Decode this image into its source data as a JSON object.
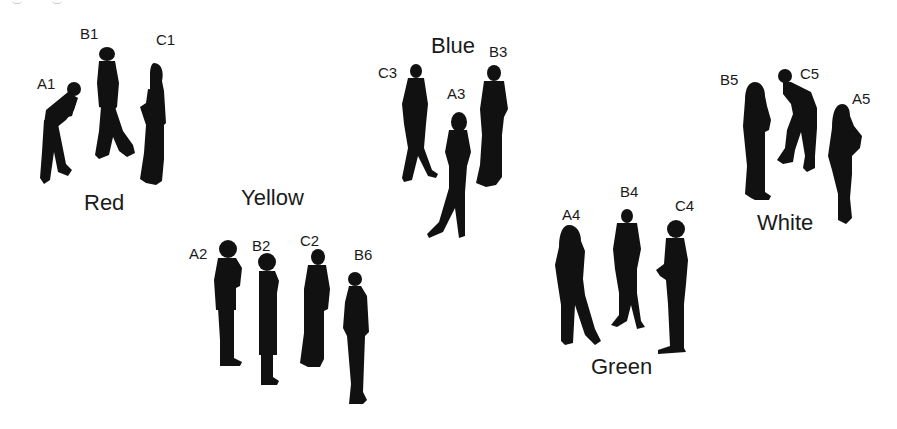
{
  "diagram": {
    "type": "grouped-people-silhouettes",
    "colors": {
      "ink": "#111111",
      "background": "#ffffff",
      "text": "#1a1a1a"
    },
    "groups": [
      {
        "name": "Red",
        "members": [
          "A1",
          "B1",
          "C1"
        ]
      },
      {
        "name": "Yellow",
        "members": [
          "A2",
          "B2",
          "C2",
          "B6"
        ]
      },
      {
        "name": "Blue",
        "members": [
          "C3",
          "A3",
          "B3"
        ]
      },
      {
        "name": "Green",
        "members": [
          "A4",
          "B4",
          "C4"
        ]
      },
      {
        "name": "White",
        "members": [
          "B5",
          "C5",
          "A5"
        ]
      }
    ],
    "labels": {
      "A1": "A1",
      "B1": "B1",
      "C1": "C1",
      "A2": "A2",
      "B2": "B2",
      "C2": "C2",
      "B6": "B6",
      "C3": "C3",
      "A3": "A3",
      "B3": "B3",
      "A4": "A4",
      "B4": "B4",
      "C4": "C4",
      "B5": "B5",
      "C5": "C5",
      "A5": "A5"
    },
    "group_labels": {
      "red": "Red",
      "yellow": "Yellow",
      "blue": "Blue",
      "green": "Green",
      "white": "White"
    }
  }
}
